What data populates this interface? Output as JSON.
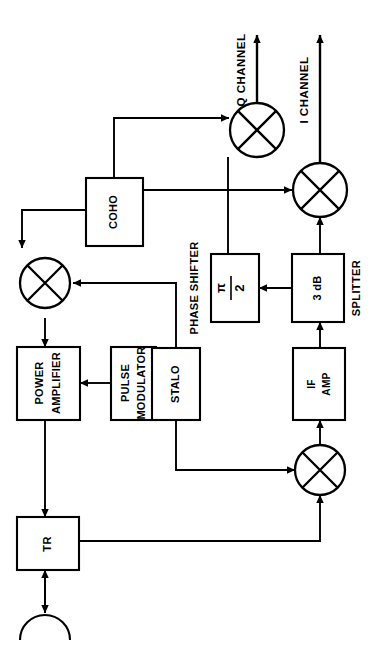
{
  "diagram": {
    "orientation": "rotated-90-ccw",
    "colors": {
      "stroke": "#000000",
      "background": "#ffffff",
      "fill": "#ffffff"
    },
    "blocks": [
      {
        "id": "coho",
        "label": "COHO",
        "lines": [
          "COHO"
        ]
      },
      {
        "id": "power-amplifier",
        "label": "POWER AMPLIFIER",
        "lines": [
          "POWER",
          "AMPLIFIER"
        ]
      },
      {
        "id": "pulse-modulator",
        "label": "PULSE MODULATOR",
        "lines": [
          "PULSE",
          "MODULATOR"
        ]
      },
      {
        "id": "stalo",
        "label": "STALO",
        "lines": [
          "STALO"
        ]
      },
      {
        "id": "tr",
        "label": "TR",
        "lines": [
          "TR"
        ]
      },
      {
        "id": "phase-shifter",
        "label": "PHASE SHIFTER",
        "lines": [
          "π",
          "2"
        ]
      },
      {
        "id": "splitter",
        "label": "SPLITTER",
        "lines": [
          "3 dB"
        ]
      },
      {
        "id": "if-amp",
        "label": "IF AMP",
        "lines": [
          "IF",
          "AMP"
        ]
      }
    ],
    "external_labels": [
      {
        "id": "phase-shifter-caption",
        "text": "PHASE SHIFTER"
      },
      {
        "id": "splitter-caption",
        "text": "SPLITTER"
      }
    ],
    "outputs": [
      {
        "id": "q-channel",
        "text": "Q CHANNEL"
      },
      {
        "id": "i-channel",
        "text": "I CHANNEL"
      }
    ],
    "mixers": [
      {
        "id": "transmit-mixer"
      },
      {
        "id": "receive-mixer"
      },
      {
        "id": "q-phase-detector"
      },
      {
        "id": "i-phase-detector"
      }
    ],
    "antenna": {
      "id": "antenna",
      "label": ""
    },
    "splitter_value": "3 dB",
    "phase_shift_numerator": "π",
    "phase_shift_denominator": "2"
  }
}
